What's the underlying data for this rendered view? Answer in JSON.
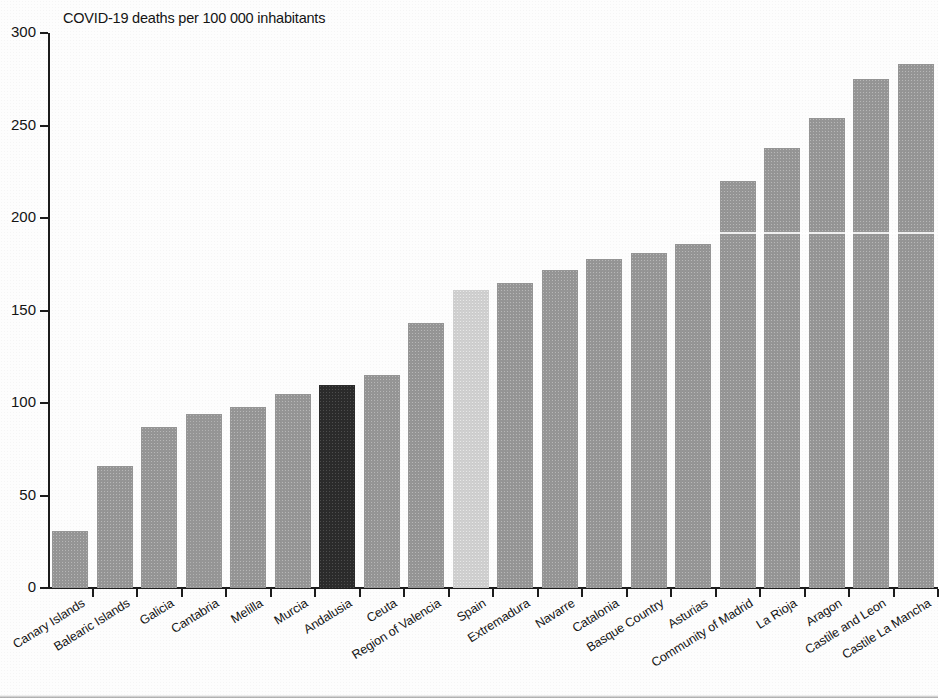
{
  "chart_data": {
    "type": "bar",
    "title": "COVID-19 deaths per 100 000 inhabitants",
    "xlabel": "",
    "ylabel": "",
    "ylim": [
      0,
      300
    ],
    "yticks": [
      0,
      50,
      100,
      150,
      200,
      250,
      300
    ],
    "ytick_labels": [
      "0",
      "50",
      "100",
      "150",
      "200",
      "250",
      "300"
    ],
    "grid": false,
    "legend": "none",
    "categories": [
      "Canary Islands",
      "Balearic Islands",
      "Galicia",
      "Cantabria",
      "Melilla",
      "Murcia",
      "Andalusia",
      "Ceuta",
      "Region of Valencia",
      "Spain",
      "Extremadura",
      "Navarre",
      "Catalonia",
      "Basque Country",
      "Asturias",
      "Community of Madrid",
      "La Rioja",
      "Aragon",
      "Castile and Leon",
      "Castile La Mancha"
    ],
    "values": [
      31,
      66,
      87,
      94,
      98,
      105,
      110,
      115,
      143,
      161,
      165,
      172,
      178,
      181,
      186,
      220,
      238,
      254,
      275,
      283
    ],
    "bar_colors": [
      "#959595",
      "#959595",
      "#959595",
      "#959595",
      "#959595",
      "#959595",
      "#2b2b2b",
      "#959595",
      "#959595",
      "#cfcfcf",
      "#959595",
      "#959595",
      "#959595",
      "#959595",
      "#959595",
      "#959595",
      "#959595",
      "#959595",
      "#959595",
      "#959595"
    ],
    "highlighted": {
      "dark": "Andalusia",
      "light": "Spain"
    },
    "colors": {
      "bar_default": "#959595",
      "bar_dark_highlight": "#2b2b2b",
      "bar_light_highlight": "#cfcfcf",
      "axis": "#1c1c1c",
      "text": "#141414",
      "background": "#fdfdfd"
    }
  }
}
